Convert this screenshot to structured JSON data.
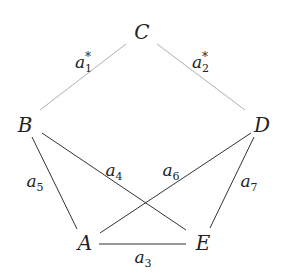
{
  "diagram": {
    "nodes": [
      {
        "id": "C",
        "label": "C",
        "x": 142,
        "y": 32
      },
      {
        "id": "B",
        "label": "B",
        "x": 25,
        "y": 125
      },
      {
        "id": "D",
        "label": "D",
        "x": 262,
        "y": 125
      },
      {
        "id": "A",
        "label": "A",
        "x": 85,
        "y": 243
      },
      {
        "id": "E",
        "label": "E",
        "x": 203,
        "y": 243
      }
    ],
    "edges": [
      {
        "from": "C",
        "to": "B",
        "label_base": "a",
        "label_sub": "1",
        "label_sup": "*",
        "color": "#b0b0b0",
        "x1": 126,
        "y1": 44,
        "x2": 40,
        "y2": 110,
        "lx": 84,
        "ly": 62
      },
      {
        "from": "C",
        "to": "D",
        "label_base": "a",
        "label_sub": "2",
        "label_sup": "*",
        "color": "#b0b0b0",
        "x1": 157,
        "y1": 44,
        "x2": 245,
        "y2": 110,
        "lx": 201,
        "ly": 62
      },
      {
        "from": "B",
        "to": "A",
        "label_base": "a",
        "label_sub": "5",
        "color": "#333333",
        "x1": 32,
        "y1": 137,
        "x2": 77,
        "y2": 229,
        "lx": 35,
        "ly": 183
      },
      {
        "from": "B",
        "to": "E",
        "label_base": "a",
        "label_sub": "4",
        "color": "#333333",
        "x1": 42,
        "y1": 133,
        "x2": 186,
        "y2": 230,
        "lx": 114,
        "ly": 172
      },
      {
        "from": "D",
        "to": "A",
        "label_base": "a",
        "label_sub": "6",
        "color": "#333333",
        "x1": 251,
        "y1": 133,
        "x2": 100,
        "y2": 233,
        "lx": 171,
        "ly": 172
      },
      {
        "from": "D",
        "to": "E",
        "label_base": "a",
        "label_sub": "7",
        "color": "#333333",
        "x1": 254,
        "y1": 137,
        "x2": 210,
        "y2": 228,
        "lx": 249,
        "ly": 183
      },
      {
        "from": "A",
        "to": "E",
        "label_base": "a",
        "label_sub": "3",
        "color": "#333333",
        "x1": 99,
        "y1": 244,
        "x2": 186,
        "y2": 244,
        "lx": 143,
        "ly": 259
      }
    ]
  }
}
